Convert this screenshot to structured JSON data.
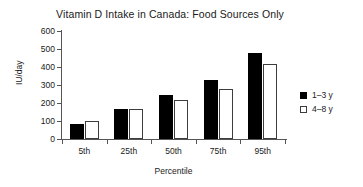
{
  "chart_data": {
    "type": "bar",
    "title": "Vitamin D Intake in Canada: Food Sources Only",
    "xlabel": "Percentile",
    "ylabel": "IU/day",
    "categories": [
      "5th",
      "25th",
      "50th",
      "75th",
      "95th"
    ],
    "series": [
      {
        "name": "1–3 y",
        "values": [
          83,
          168,
          245,
          327,
          480
        ],
        "color": "#000000",
        "fill": "solid"
      },
      {
        "name": "4–8 y",
        "values": [
          100,
          166,
          217,
          278,
          415
        ],
        "color": "#ffffff",
        "fill": "open"
      }
    ],
    "ylim": [
      0,
      600
    ],
    "yticks": [
      0,
      100,
      200,
      300,
      400,
      500,
      600
    ],
    "ytick_labels": [
      "0",
      "100",
      "200",
      "300",
      "400",
      "500",
      "600"
    ],
    "grid": false,
    "legend_position": "right"
  }
}
